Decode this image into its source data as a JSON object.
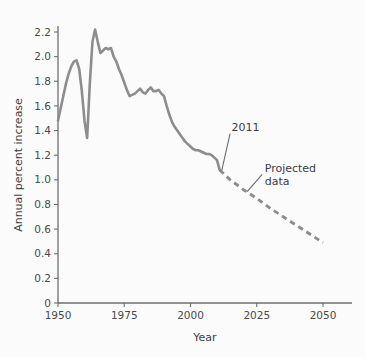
{
  "chart_data": {
    "type": "line",
    "title": "",
    "xlabel": "Year",
    "ylabel": "Annual percent increase",
    "xlim": [
      1950,
      2052
    ],
    "ylim": [
      0,
      2.3
    ],
    "grid": false,
    "legend_position": "none",
    "xticks": [
      1950,
      1975,
      2000,
      2025,
      2050
    ],
    "xtick_labels": [
      "1950",
      "1975",
      "2000",
      "2025",
      "2050"
    ],
    "yticks": [
      0,
      0.2,
      0.4,
      0.6,
      0.8,
      1.0,
      1.2,
      1.4,
      1.6,
      1.8,
      2.0,
      2.2
    ],
    "ytick_labels": [
      "0",
      "0.2",
      "0.4",
      "0.6",
      "0.8",
      "1.0",
      "1.2",
      "1.4",
      "1.6",
      "1.8",
      "2.0",
      "2.2"
    ],
    "line_color": "#8d8d8d",
    "series": [
      {
        "name": "Historical data",
        "style": "solid",
        "x": [
          1950,
          1951,
          1952,
          1953,
          1954,
          1955,
          1956,
          1957,
          1958,
          1959,
          1960,
          1961,
          1962,
          1963,
          1964,
          1965,
          1966,
          1967,
          1968,
          1969,
          1970,
          1971,
          1972,
          1973,
          1974,
          1975,
          1976,
          1977,
          1978,
          1979,
          1980,
          1981,
          1982,
          1983,
          1984,
          1985,
          1986,
          1987,
          1988,
          1989,
          1990,
          1991,
          1992,
          1993,
          1994,
          1995,
          1996,
          1997,
          1998,
          1999,
          2000,
          2001,
          2002,
          2003,
          2004,
          2005,
          2006,
          2007,
          2008,
          2009,
          2010,
          2011
        ],
        "y": [
          1.48,
          1.58,
          1.68,
          1.78,
          1.86,
          1.92,
          1.96,
          1.97,
          1.9,
          1.72,
          1.48,
          1.34,
          1.78,
          2.12,
          2.22,
          2.12,
          2.03,
          2.05,
          2.07,
          2.06,
          2.07,
          2.0,
          1.96,
          1.9,
          1.85,
          1.79,
          1.73,
          1.68,
          1.69,
          1.7,
          1.72,
          1.74,
          1.71,
          1.7,
          1.73,
          1.75,
          1.72,
          1.72,
          1.73,
          1.7,
          1.68,
          1.6,
          1.53,
          1.47,
          1.43,
          1.4,
          1.37,
          1.34,
          1.31,
          1.29,
          1.27,
          1.25,
          1.24,
          1.24,
          1.23,
          1.22,
          1.21,
          1.21,
          1.2,
          1.18,
          1.16,
          1.08
        ]
      },
      {
        "name": "Projected data",
        "style": "dashed",
        "x": [
          2011,
          2015,
          2020,
          2025,
          2030,
          2035,
          2040,
          2045,
          2050
        ],
        "y": [
          1.08,
          1.0,
          0.92,
          0.85,
          0.77,
          0.7,
          0.63,
          0.56,
          0.49
        ]
      }
    ],
    "annotations": [
      {
        "name": "2011",
        "text": "2011",
        "x": 2015.5,
        "y": 1.4,
        "points_to_x": 2011,
        "points_to_y": 1.08
      },
      {
        "name": "Projected data",
        "text_lines": [
          "Projected",
          "data"
        ],
        "x": 2028,
        "y": 1.06,
        "points_to_x": 2021,
        "points_to_y": 0.92
      }
    ]
  }
}
